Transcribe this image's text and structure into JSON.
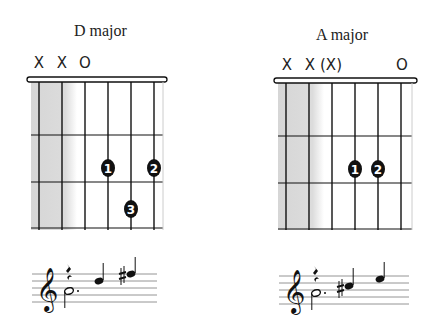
{
  "chords": [
    {
      "name": "D major",
      "markers": [
        {
          "string": 1,
          "symbol": "X"
        },
        {
          "string": 2,
          "symbol": "X"
        },
        {
          "string": 3,
          "symbol": "O"
        }
      ],
      "fingers": [
        {
          "label": "1",
          "string": 4,
          "fret": 2
        },
        {
          "label": "2",
          "string": 6,
          "fret": 2
        },
        {
          "label": "3",
          "string": 5,
          "fret": 3
        }
      ],
      "notation": {
        "clef": "treble",
        "notes": [
          "quarter rest over dotted half A",
          "D quarter",
          "F# quarter"
        ]
      }
    },
    {
      "name": "A major",
      "markers": [
        {
          "string": 1,
          "symbol": "X"
        },
        {
          "string": 2,
          "symbol": "X"
        },
        {
          "string": 3,
          "symbol": "(X)"
        },
        {
          "string": 6,
          "symbol": "O"
        }
      ],
      "fingers": [
        {
          "label": "1",
          "string": 4,
          "fret": 2
        },
        {
          "label": "2",
          "string": 5,
          "fret": 2
        }
      ],
      "notation": {
        "clef": "treble",
        "notes": [
          "quarter rest over dotted half A",
          "C# quarter",
          "E quarter"
        ]
      }
    }
  ],
  "colors": {
    "ink": "#111111",
    "shade": "#d9d9d9",
    "background": "#ffffff"
  }
}
